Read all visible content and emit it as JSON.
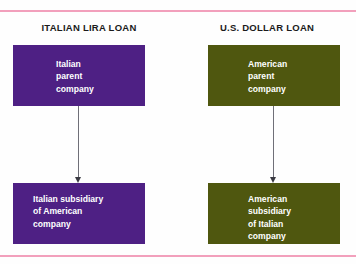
{
  "figure": {
    "background_color": "#fefefe",
    "rule_color": "#f2a0bc"
  },
  "panels": [
    {
      "id": "italian-lira-loan",
      "title": "ITALIAN LIRA LOAN",
      "accent_color": "#4e2084",
      "parent_box": {
        "label": "Italian\nparent\ncompany",
        "fill": "#4e2084",
        "text_color": "#ffffff"
      },
      "subsidiary_box": {
        "label": "Italian subsidiary\nof American\ncompany",
        "fill": "#4e2084",
        "text_color": "#ffffff"
      },
      "arrow": {
        "direction": "down",
        "from": "parent_box",
        "to": "subsidiary_box",
        "color": "#6f6f78"
      }
    },
    {
      "id": "us-dollar-loan",
      "title": "U.S. DOLLAR LOAN",
      "accent_color": "#4f570f",
      "parent_box": {
        "label": "American\nparent\ncompany",
        "fill": "#4f570f",
        "text_color": "#ffffff"
      },
      "subsidiary_box": {
        "label": "American\nsubsidiary\nof Italian\ncompany",
        "fill": "#4f570f",
        "text_color": "#ffffff"
      },
      "arrow": {
        "direction": "down",
        "from": "parent_box",
        "to": "subsidiary_box",
        "color": "#6f6f78"
      }
    }
  ]
}
